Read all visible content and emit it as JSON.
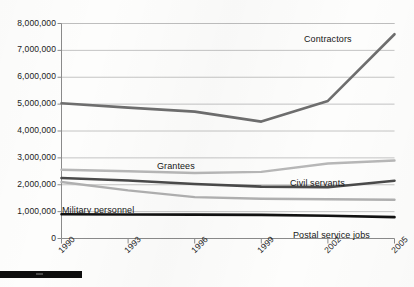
{
  "chart_data": {
    "type": "line",
    "title": "",
    "subtitle": "",
    "xlabel": "",
    "ylabel": "",
    "x": [
      1990,
      1993,
      1996,
      1999,
      2002,
      2005
    ],
    "xtick_labels": [
      "1990",
      "1993",
      "1996",
      "1999",
      "2002",
      "2005"
    ],
    "ytick_labels": [
      "8,000,000",
      "7,000,000",
      "6,000,000",
      "5,000,000",
      "4,000,000",
      "3,000,000",
      "2,000,000",
      "1,000,000",
      "0"
    ],
    "ytick_values": [
      8000000,
      7000000,
      6000000,
      5000000,
      4000000,
      3000000,
      2000000,
      1000000,
      0
    ],
    "ylim": [
      0,
      8000000
    ],
    "xlim": [
      1990,
      2005
    ],
    "grid": "horizontal",
    "legend": "inline-annotations",
    "series": [
      {
        "name": "Contractors",
        "color": "#6e6e6e",
        "width": 2.6,
        "values": [
          5030000,
          4870000,
          4720000,
          4350000,
          5120000,
          7600000
        ]
      },
      {
        "name": "Grantees",
        "color": "#b7b7b7",
        "width": 2.4,
        "values": [
          2560000,
          2500000,
          2440000,
          2480000,
          2790000,
          2900000
        ]
      },
      {
        "name": "Civil servants",
        "color": "#4a4a4a",
        "width": 2.6,
        "values": [
          2250000,
          2160000,
          2030000,
          1930000,
          1910000,
          2150000
        ]
      },
      {
        "name": "Military personnel",
        "color": "#b0b0b0",
        "width": 2.4,
        "values": [
          2100000,
          1790000,
          1540000,
          1480000,
          1460000,
          1440000
        ]
      },
      {
        "name": "Postal service jobs",
        "color": "#111111",
        "width": 2.6,
        "values": [
          900000,
          895000,
          890000,
          880000,
          845000,
          795000
        ]
      }
    ],
    "annotations": [
      {
        "text": "Contractors",
        "x_px": 304,
        "y_px": 34
      },
      {
        "text": "Grantees",
        "x_px": 157,
        "y_px": 161
      },
      {
        "text": "Civil servants",
        "x_px": 290,
        "y_px": 178
      },
      {
        "text": "Military personnel",
        "x_px": 62,
        "y_px": 205
      },
      {
        "text": "Postal service jobs",
        "x_px": 293,
        "y_px": 230
      }
    ]
  },
  "axes": {
    "axis_color": "#8a8a8a",
    "grid_color": "#bdbdbd",
    "text_color": "#1b1b1b"
  }
}
